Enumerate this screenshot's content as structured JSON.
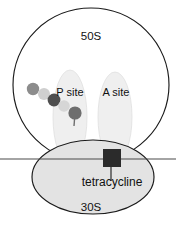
{
  "diagram": {
    "subunits": [
      {
        "id": "large",
        "label": "50S",
        "shape": "circle",
        "fill": "#ffffff",
        "stroke": "#1a1a1a"
      },
      {
        "id": "small",
        "label": "30S",
        "shape": "ellipse",
        "fill": "#e3e3e3",
        "stroke": "#1a1a1a"
      }
    ],
    "sites": [
      {
        "id": "p-site",
        "label": "P site",
        "fill": "#efefef"
      },
      {
        "id": "a-site",
        "label": "A site",
        "fill": "#efefef"
      }
    ],
    "drug": {
      "label": "tetracycline",
      "marker": "square",
      "color": "#2b2b2b"
    },
    "mrna": {
      "label": "",
      "color": "#4a4a4a"
    },
    "peptide_chain": {
      "label": "",
      "beads": [
        {
          "order": 1,
          "color": "#8c8c8c",
          "cx": 33,
          "cy": 89,
          "r": 6.2
        },
        {
          "order": 2,
          "color": "#cfcfcf",
          "cx": 44,
          "cy": 94,
          "r": 6.0
        },
        {
          "order": 3,
          "color": "#4f4f4f",
          "cx": 54,
          "cy": 100,
          "r": 6.4
        },
        {
          "order": 4,
          "color": "#d6d6d6",
          "cx": 64,
          "cy": 106,
          "r": 5.8
        },
        {
          "order": 5,
          "color": "#6e6e6e",
          "cx": 75,
          "cy": 113,
          "r": 6.6
        }
      ]
    }
  }
}
